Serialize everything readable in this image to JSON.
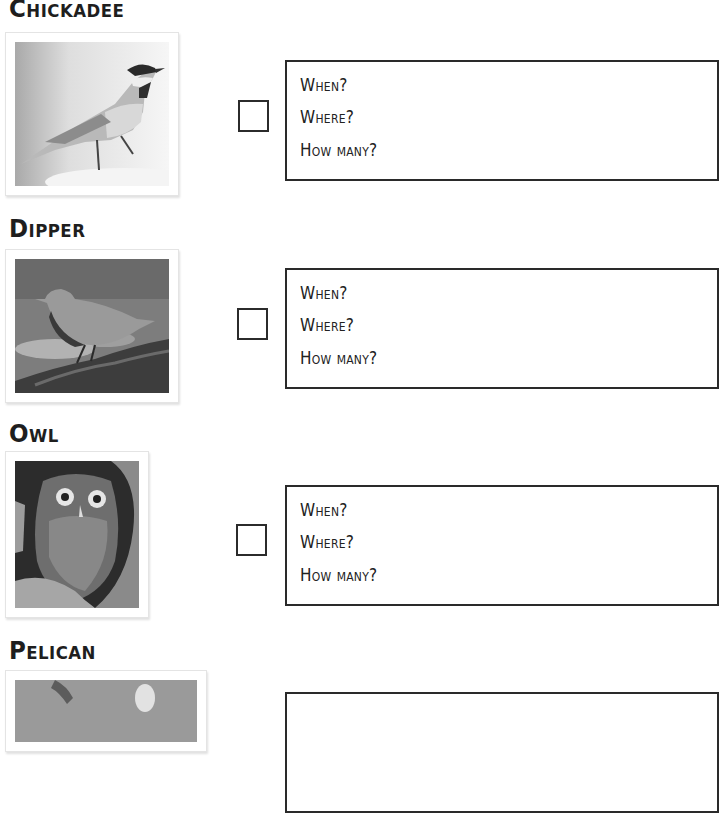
{
  "birds": [
    {
      "name": "Chickadee",
      "photo_icon": "chickadee-photo",
      "checked": false,
      "prompts": [
        "When?",
        "Where?",
        "How many?"
      ]
    },
    {
      "name": "Dipper",
      "photo_icon": "dipper-photo",
      "checked": false,
      "prompts": [
        "When?",
        "Where?",
        "How many?"
      ]
    },
    {
      "name": "Owl",
      "photo_icon": "owl-photo",
      "checked": false,
      "prompts": [
        "When?",
        "Where?",
        "How many?"
      ]
    },
    {
      "name": "Pelican",
      "photo_icon": "pelican-photo",
      "checked": false,
      "prompts": []
    }
  ],
  "colors": {
    "ink": "#1e1e1e",
    "frame_border": "#e4e4e4",
    "box_border": "#2a2a2a"
  }
}
